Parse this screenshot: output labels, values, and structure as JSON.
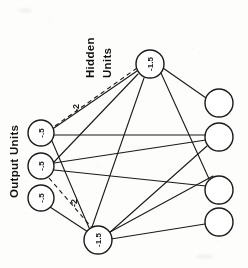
{
  "figure": {
    "background_color": "#fdfdfb",
    "stroke_color": "#1a1a1a",
    "rotation_note": "page scanned sideways; text rotated 90 degrees counter-clockwise"
  },
  "group_labels": {
    "hidden": "Hidden\nUnits",
    "hidden_line_1": "Hidden",
    "hidden_line_2": "Units",
    "output": "Output Units"
  },
  "nodes": {
    "hidden_units": [
      {
        "id": "h1",
        "label": "-1.5",
        "cx": 150,
        "cy": 64,
        "r": 14
      },
      {
        "id": "h2",
        "label": "-1.5",
        "cx": 98,
        "cy": 240,
        "r": 14
      }
    ],
    "output_units": [
      {
        "id": "o1",
        "label": "-.5",
        "cx": 41,
        "cy": 133,
        "r": 13
      },
      {
        "id": "o2",
        "label": "-.5",
        "cx": 41,
        "cy": 166,
        "r": 13
      },
      {
        "id": "o3",
        "label": "-.5",
        "cx": 41,
        "cy": 198,
        "r": 13
      }
    ],
    "input_units": [
      {
        "id": "i1",
        "label": "",
        "cx": 219,
        "cy": 103,
        "r": 14
      },
      {
        "id": "i2",
        "label": "",
        "cx": 219,
        "cy": 137,
        "r": 14
      },
      {
        "id": "i3",
        "label": "",
        "cx": 219,
        "cy": 190,
        "r": 14
      },
      {
        "id": "i4",
        "label": "",
        "cx": 219,
        "cy": 222,
        "r": 14
      }
    ]
  },
  "edge_labels": [
    {
      "id": "w1",
      "text": "-2",
      "x": 76,
      "y": 108,
      "style": "dashed"
    },
    {
      "id": "w2",
      "text": "-2",
      "x": 74,
      "y": 203,
      "style": "dashed"
    }
  ],
  "edges": {
    "solid_count": 12,
    "dashed_count": 2
  }
}
